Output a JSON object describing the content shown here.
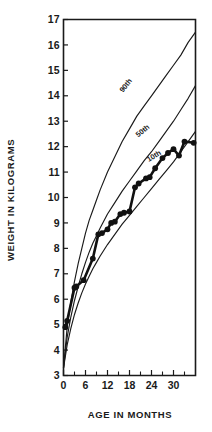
{
  "chart_data": {
    "type": "line",
    "title": "",
    "xlabel": "AGE IN MONTHS",
    "ylabel": "WEIGHT IN KILOGRAMS",
    "xlim": [
      0,
      36
    ],
    "ylim": [
      3,
      17
    ],
    "grid": false,
    "legend_position": "inline-curve-labels",
    "x_ticks_major": [
      0,
      6,
      12,
      18,
      24,
      30
    ],
    "x_ticks_minor": [
      3,
      9,
      15,
      21,
      27,
      33
    ],
    "y_ticks": [
      3,
      4,
      5,
      6,
      7,
      8,
      9,
      10,
      11,
      12,
      13,
      14,
      15,
      16,
      17
    ],
    "x_tick_labels": [
      "0",
      "6",
      "12",
      "18",
      "24",
      "30"
    ],
    "y_tick_labels": [
      "3",
      "4",
      "5",
      "6",
      "7",
      "8",
      "9",
      "10",
      "11",
      "12",
      "13",
      "14",
      "15",
      "16",
      "17"
    ],
    "series": [
      {
        "name": "90th",
        "label": "90th",
        "style": "thin-line",
        "label_point": {
          "x": 17.5,
          "y": 14.35
        },
        "label_rotation": -52,
        "x": [
          0,
          1,
          2,
          3,
          4,
          5,
          6,
          7,
          8,
          9,
          10,
          12,
          14,
          16,
          18,
          20,
          22,
          24,
          26,
          28,
          30,
          32,
          34,
          36
        ],
        "y": [
          3.3,
          4.9,
          5.9,
          6.7,
          7.4,
          8.0,
          8.6,
          9.1,
          9.5,
          9.9,
          10.3,
          11.0,
          11.6,
          12.2,
          12.7,
          13.2,
          13.6,
          14.0,
          14.4,
          14.8,
          15.2,
          15.6,
          16.1,
          16.5
        ]
      },
      {
        "name": "50th",
        "label": "50th",
        "style": "thin-line",
        "label_point": {
          "x": 22.0,
          "y": 12.55
        },
        "label_rotation": -40,
        "x": [
          0,
          1,
          2,
          3,
          4,
          5,
          6,
          7,
          8,
          9,
          10,
          12,
          14,
          16,
          18,
          20,
          22,
          24,
          26,
          28,
          30,
          32,
          34,
          36
        ],
        "y": [
          3.3,
          4.5,
          5.3,
          5.95,
          6.5,
          7.0,
          7.45,
          7.85,
          8.2,
          8.5,
          8.8,
          9.35,
          9.8,
          10.25,
          10.65,
          11.05,
          11.45,
          11.8,
          12.2,
          12.6,
          13.0,
          13.45,
          13.9,
          14.4
        ]
      },
      {
        "name": "10th",
        "label": "10th",
        "style": "thin-line",
        "label_point": {
          "x": 25.0,
          "y": 11.55
        },
        "label_rotation": -32,
        "x": [
          0,
          1,
          2,
          3,
          4,
          5,
          6,
          7,
          8,
          9,
          10,
          12,
          14,
          16,
          18,
          20,
          22,
          24,
          26,
          28,
          30,
          32,
          34,
          36
        ],
        "y": [
          3.3,
          4.2,
          4.85,
          5.4,
          5.85,
          6.25,
          6.6,
          6.9,
          7.2,
          7.45,
          7.7,
          8.15,
          8.55,
          8.95,
          9.3,
          9.65,
          10.0,
          10.35,
          10.7,
          11.05,
          11.4,
          11.8,
          12.2,
          12.6
        ]
      },
      {
        "name": "subject",
        "label": "",
        "style": "thick-line-with-markers",
        "x": [
          0.5,
          1.0,
          3.0,
          3.5,
          5.5,
          8.0,
          9.5,
          10.5,
          12.0,
          13.0,
          14.0,
          15.5,
          16.5,
          18.0,
          19.5,
          20.5,
          22.5,
          23.5,
          25.0,
          27.0,
          28.5,
          30.0,
          31.5,
          33.0,
          35.5
        ],
        "y": [
          4.9,
          5.15,
          6.45,
          6.5,
          6.75,
          7.6,
          8.55,
          8.6,
          8.75,
          9.0,
          9.05,
          9.35,
          9.4,
          9.45,
          10.4,
          10.55,
          10.75,
          10.8,
          11.15,
          11.55,
          11.75,
          11.9,
          11.65,
          12.2,
          12.15
        ]
      }
    ]
  }
}
